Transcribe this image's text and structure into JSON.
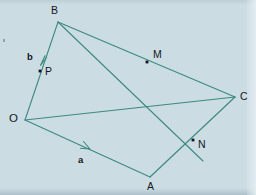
{
  "figure": {
    "background_color": "#cbdce3",
    "line_color": "#3d8a80",
    "label_color": "#14171c",
    "width": 256,
    "height": 195
  },
  "vertices": [
    {
      "id": "O",
      "label": "O",
      "x": 25,
      "y": 120,
      "label_x": 9,
      "label_y": 114,
      "has_dot": false
    },
    {
      "id": "B",
      "label": "B",
      "x": 58,
      "y": 22,
      "label_x": 51,
      "label_y": 6,
      "has_dot": false
    },
    {
      "id": "C",
      "label": "C",
      "x": 235,
      "y": 97,
      "label_x": 240,
      "label_y": 92,
      "has_dot": false
    },
    {
      "id": "A",
      "label": "A",
      "x": 150,
      "y": 177,
      "label_x": 147,
      "label_y": 181,
      "has_dot": false
    }
  ],
  "points": [
    {
      "id": "M",
      "label": "M",
      "x": 147,
      "y": 62,
      "label_x": 153,
      "label_y": 49,
      "has_dot": true
    },
    {
      "id": "N",
      "label": "N",
      "x": 193,
      "y": 140,
      "label_x": 198,
      "label_y": 140,
      "has_dot": true
    },
    {
      "id": "P",
      "label": "P",
      "x": 40,
      "y": 71,
      "label_x": 45,
      "label_y": 66,
      "has_dot": true
    }
  ],
  "vectors": [
    {
      "id": "a",
      "label": "a",
      "label_x": 78,
      "label_y": 155,
      "along": "O-A",
      "arrow_at_x": 88,
      "arrow_at_y": 149
    },
    {
      "id": "b",
      "label": "b",
      "label_x": 27,
      "label_y": 52,
      "along": "B-O",
      "arrow_at_x": 41,
      "arrow_at_y": 64
    }
  ],
  "segments": [
    {
      "id": "OB",
      "from": "O",
      "to": "B",
      "x1": 25,
      "y1": 120,
      "x2": 58,
      "y2": 22
    },
    {
      "id": "OA",
      "from": "O",
      "to": "A",
      "x1": 25,
      "y1": 120,
      "x2": 150,
      "y2": 177
    },
    {
      "id": "AC",
      "from": "A",
      "to": "C",
      "x1": 150,
      "y1": 177,
      "x2": 235,
      "y2": 97
    },
    {
      "id": "BC",
      "from": "B",
      "to": "C",
      "x1": 58,
      "y1": 22,
      "x2": 235,
      "y2": 97
    },
    {
      "id": "BN",
      "from": "B",
      "to": "N-A",
      "x1": 58,
      "y1": 22,
      "x2": 204,
      "y2": 162
    },
    {
      "id": "OM",
      "from": "O",
      "to": "M-C",
      "x1": 25,
      "y1": 120,
      "x2": 235,
      "y2": 97
    }
  ]
}
